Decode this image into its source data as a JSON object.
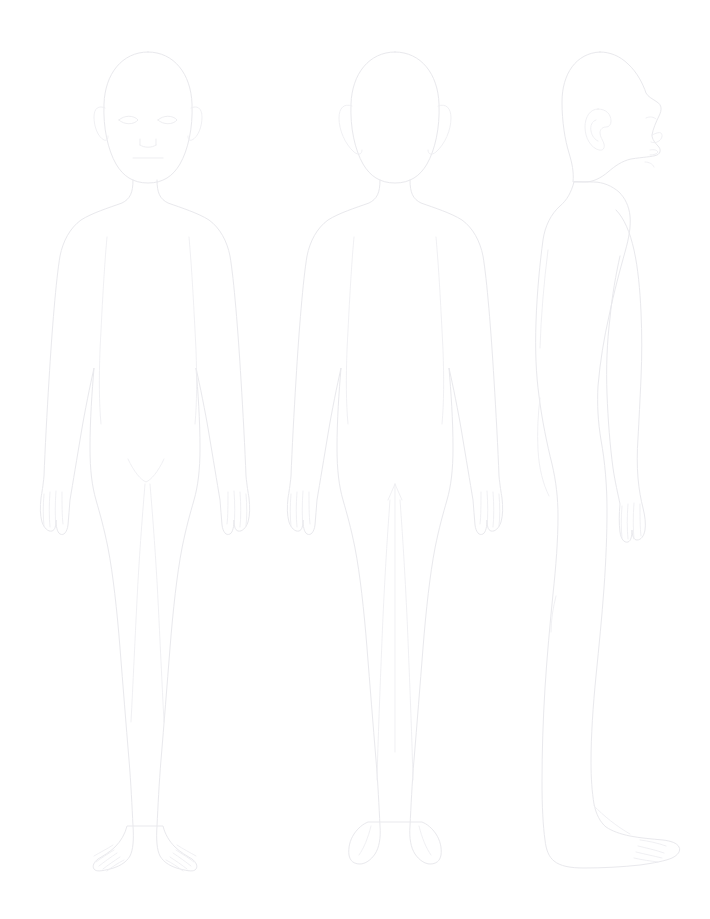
{
  "document": {
    "title": "Body Diagram Chart",
    "background_color": "#ffffff",
    "outline_color": "#e9e9ed",
    "detail_color": "#ededf1",
    "width": 710,
    "height": 919
  },
  "figures": [
    {
      "id": "anterior",
      "name": "Anterior view",
      "label": "",
      "center_x": 148,
      "top_y": 52,
      "bottom_y": 876,
      "features": [
        "head-oval",
        "left-eye",
        "right-eye",
        "nose",
        "mouth",
        "left-ear",
        "right-ear",
        "neck",
        "shoulders",
        "torso",
        "arms",
        "hands-with-fingers",
        "crotch",
        "legs",
        "feet-with-toes"
      ]
    },
    {
      "id": "posterior",
      "name": "Posterior view",
      "label": "",
      "center_x": 395,
      "top_y": 52,
      "bottom_y": 876,
      "features": [
        "head-oval",
        "left-ear",
        "right-ear",
        "neck",
        "shoulders",
        "back",
        "arms",
        "hands-with-fingers",
        "gluteal-cleft-arrow",
        "legs",
        "heels"
      ]
    },
    {
      "id": "lateral",
      "name": "Lateral view",
      "label": "",
      "center_x": 605,
      "top_y": 52,
      "bottom_y": 876,
      "facing": "right",
      "features": [
        "head-profile",
        "nose-profile",
        "lips-profile",
        "chin-profile",
        "ear-with-whorl",
        "neck",
        "back-curve",
        "chest",
        "buttock",
        "arm",
        "hand-with-fingers",
        "leg",
        "foot-with-toes"
      ]
    }
  ]
}
